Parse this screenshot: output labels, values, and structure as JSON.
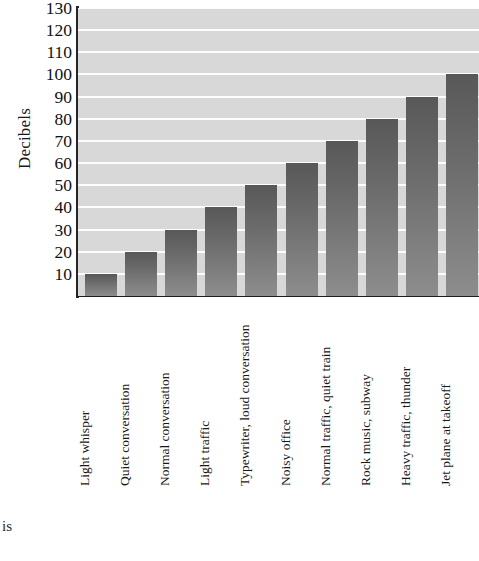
{
  "chart_data": {
    "type": "bar",
    "title": "",
    "xlabel": "",
    "ylabel": "Decibels",
    "ylim": [
      0,
      130
    ],
    "ytick_step": 10,
    "grid": true,
    "legend": "none",
    "categories": [
      "Light whisper",
      "Quiet conversation",
      "Normal conversation",
      "Light traffic",
      "Typewriter, loud conversation",
      "Noisy office",
      "Normal traffic, quiet train",
      "Rock music, subway",
      "Heavy traffic, thunder",
      "Jet plane at takeoff"
    ],
    "values": [
      10,
      20,
      30,
      40,
      50,
      60,
      70,
      80,
      90,
      100
    ],
    "ytick_labels": [
      "130",
      "120",
      "110",
      "100",
      "90",
      "80",
      "70",
      "60",
      "50",
      "40",
      "30",
      "20",
      "10"
    ],
    "colors": {
      "plot_background": "#d8d8d8",
      "gridline": "#fdfdfd",
      "bar_top": "#585858",
      "bar_bottom": "#8d8d8d",
      "axis": "#1f1f1f",
      "text": "#171717",
      "page_background": "#ffffff"
    }
  },
  "caption": {
    "fragment": "is"
  }
}
